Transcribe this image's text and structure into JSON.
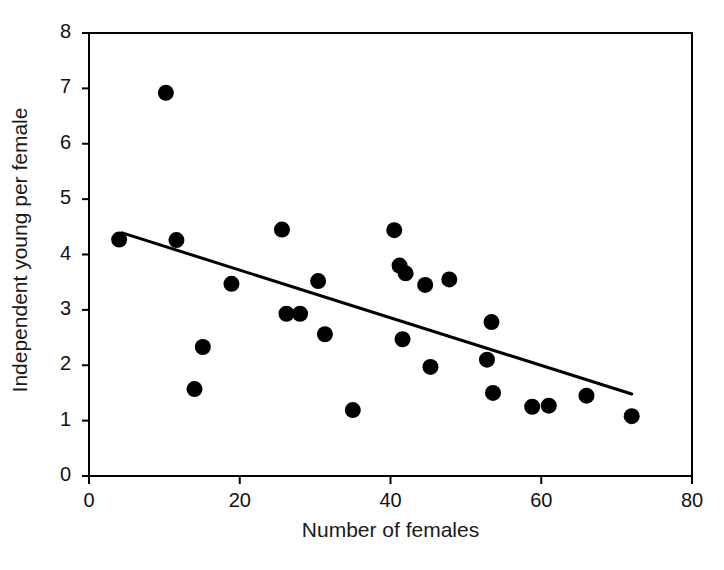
{
  "chart_data": {
    "type": "scatter",
    "title": "",
    "xlabel": "Number of females",
    "ylabel": "Independent young per female",
    "xlim": [
      0,
      80
    ],
    "ylim": [
      0,
      8
    ],
    "xticks": [
      0,
      20,
      40,
      60,
      80
    ],
    "yticks": [
      0,
      1,
      2,
      3,
      4,
      5,
      6,
      7,
      8
    ],
    "grid": false,
    "legend": null,
    "marker": {
      "shape": "circle",
      "color": "#000000",
      "size": 9
    },
    "points": [
      {
        "x": 4.0,
        "y": 4.27
      },
      {
        "x": 10.2,
        "y": 6.92
      },
      {
        "x": 11.6,
        "y": 4.26
      },
      {
        "x": 14.0,
        "y": 1.57
      },
      {
        "x": 15.1,
        "y": 2.33
      },
      {
        "x": 18.9,
        "y": 3.47
      },
      {
        "x": 25.6,
        "y": 4.45
      },
      {
        "x": 26.2,
        "y": 2.93
      },
      {
        "x": 28.0,
        "y": 2.93
      },
      {
        "x": 30.4,
        "y": 3.52
      },
      {
        "x": 31.3,
        "y": 2.56
      },
      {
        "x": 35.0,
        "y": 1.19
      },
      {
        "x": 40.5,
        "y": 4.44
      },
      {
        "x": 41.2,
        "y": 3.8
      },
      {
        "x": 42.0,
        "y": 3.66
      },
      {
        "x": 41.6,
        "y": 2.47
      },
      {
        "x": 44.6,
        "y": 3.45
      },
      {
        "x": 45.3,
        "y": 1.97
      },
      {
        "x": 47.8,
        "y": 3.55
      },
      {
        "x": 52.8,
        "y": 2.1
      },
      {
        "x": 53.4,
        "y": 2.78
      },
      {
        "x": 53.6,
        "y": 1.5
      },
      {
        "x": 58.8,
        "y": 1.25
      },
      {
        "x": 61.0,
        "y": 1.27
      },
      {
        "x": 66.0,
        "y": 1.45
      },
      {
        "x": 72.0,
        "y": 1.08
      }
    ],
    "trendline": {
      "x_start": 4.4,
      "y_start": 4.39,
      "x_end": 72.0,
      "y_end": 1.48
    }
  },
  "ticks": {
    "y": [
      "8",
      "7",
      "6",
      "5",
      "4",
      "3",
      "2",
      "1",
      "0"
    ],
    "x": [
      "0",
      "20",
      "40",
      "60",
      "80"
    ]
  },
  "labels": {
    "x_axis": "Number of females",
    "y_axis": "Independent young per female"
  },
  "colors": {
    "axis": "#000000",
    "marker": "#000000",
    "trendline": "#000000",
    "background": "#ffffff"
  }
}
